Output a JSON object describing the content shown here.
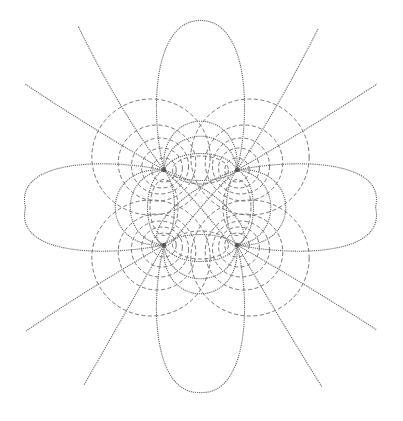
{
  "diagram": {
    "type": "field-line-diagram",
    "colors": {
      "background": "#ffffff",
      "field_line": "#6a6a6a",
      "equipotential": "#777777",
      "charge": "#555555"
    },
    "charges": [
      {
        "id": "top-left"
      },
      {
        "id": "top-right"
      },
      {
        "id": "bottom-left"
      },
      {
        "id": "bottom-right"
      }
    ],
    "legend": {
      "field_lines": "solid dotted curves",
      "equipotentials": "dashed curves"
    }
  }
}
